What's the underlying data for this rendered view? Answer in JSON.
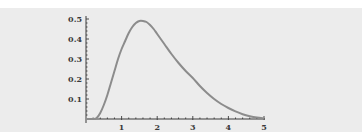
{
  "chart_data": {
    "type": "line",
    "title": "",
    "xlabel": "",
    "ylabel": "",
    "xlim": [
      0,
      5
    ],
    "ylim": [
      0,
      0.5
    ],
    "grid": false,
    "legend": null,
    "x_ticks": [
      "1",
      "2",
      "3",
      "4",
      "5"
    ],
    "y_ticks": [
      "0.1",
      "0.2",
      "0.3",
      "0.4",
      "0.5"
    ],
    "series": [
      {
        "name": "density",
        "color": "#8c8c8c",
        "x": [
          0.0,
          0.2,
          0.3,
          0.4,
          0.5,
          0.6,
          0.7,
          0.8,
          0.9,
          1.0,
          1.1,
          1.2,
          1.3,
          1.4,
          1.5,
          1.6,
          1.7,
          1.8,
          1.9,
          2.0,
          2.2,
          2.4,
          2.6,
          2.8,
          3.0,
          3.2,
          3.4,
          3.6,
          3.8,
          4.0,
          4.2,
          4.4,
          4.6,
          4.8,
          5.0
        ],
        "values": [
          0.0,
          0.0,
          0.005,
          0.03,
          0.07,
          0.12,
          0.18,
          0.24,
          0.3,
          0.35,
          0.39,
          0.43,
          0.46,
          0.48,
          0.49,
          0.49,
          0.485,
          0.47,
          0.45,
          0.425,
          0.375,
          0.325,
          0.28,
          0.24,
          0.205,
          0.165,
          0.13,
          0.1,
          0.075,
          0.055,
          0.038,
          0.024,
          0.014,
          0.007,
          0.003
        ]
      }
    ]
  },
  "colors": {
    "background": "#ececec",
    "axis": "#3a3a3a",
    "curve": "#8c8c8c"
  }
}
